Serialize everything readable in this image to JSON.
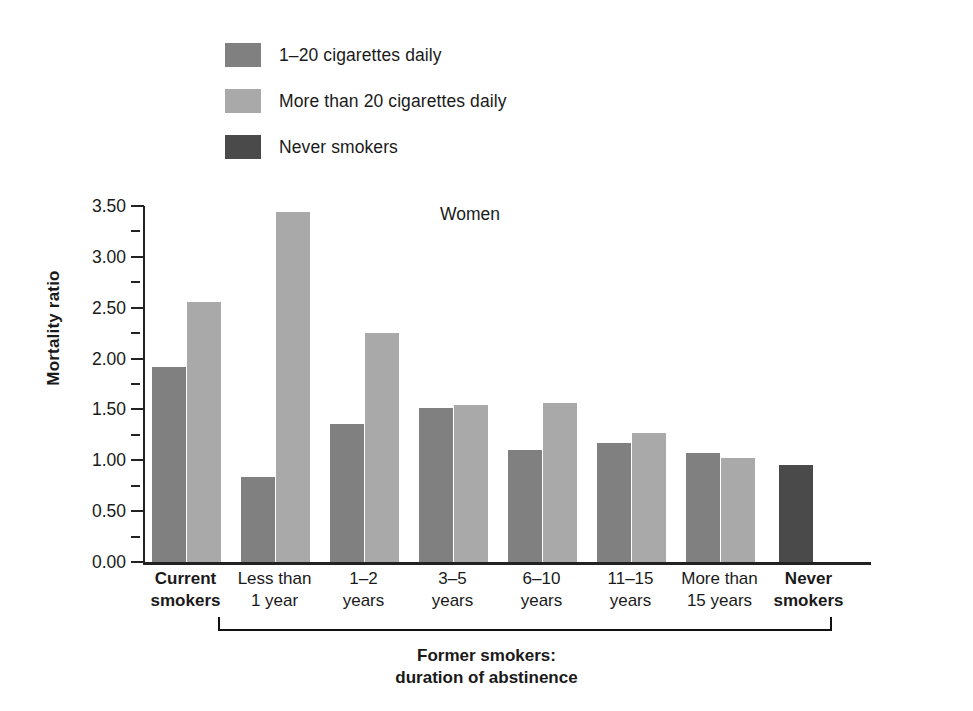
{
  "legend": {
    "items": [
      {
        "label": "1–20 cigarettes daily",
        "color": "#808080",
        "key": "light_smoker"
      },
      {
        "label": "More than 20 cigarettes daily",
        "color": "#a9a9a9",
        "key": "heavy_smoker"
      },
      {
        "label": "Never smokers",
        "color": "#4a4a4a",
        "key": "never_smoker"
      }
    ]
  },
  "chart_data": {
    "type": "bar",
    "title": "Women",
    "xlabel": "",
    "ylabel": "Mortality ratio",
    "ylim": [
      0.0,
      3.5
    ],
    "ytick_labels": [
      "0.00",
      "0.50",
      "1.00",
      "1.50",
      "2.00",
      "2.50",
      "3.00",
      "3.50"
    ],
    "ytick_values": [
      0.0,
      0.5,
      1.0,
      1.5,
      2.0,
      2.5,
      3.0,
      3.5
    ],
    "minor_tick_step": 0.25,
    "grid": false,
    "legend_position": "top-left",
    "categories": [
      "Current smokers",
      "Less than 1 year",
      "1–2 years",
      "3–5 years",
      "6–10 years",
      "11–15 years",
      "More than 15 years",
      "Never smokers"
    ],
    "category_lines": [
      [
        "Current",
        "smokers"
      ],
      [
        "Less than",
        "1 year"
      ],
      [
        "1–2",
        "years"
      ],
      [
        "3–5",
        "years"
      ],
      [
        "6–10",
        "years"
      ],
      [
        "11–15",
        "years"
      ],
      [
        "More than",
        "15 years"
      ],
      [
        "Never",
        "smokers"
      ]
    ],
    "series": [
      {
        "name": "1–20 cigarettes daily",
        "color": "#808080",
        "values": [
          1.92,
          0.84,
          1.36,
          1.51,
          1.1,
          1.17,
          1.07,
          null
        ]
      },
      {
        "name": "More than 20 cigarettes daily",
        "color": "#a9a9a9",
        "values": [
          2.56,
          3.44,
          2.25,
          1.54,
          1.56,
          1.27,
          1.02,
          null
        ]
      },
      {
        "name": "Never smokers",
        "color": "#4a4a4a",
        "values": [
          null,
          null,
          null,
          null,
          null,
          null,
          null,
          0.95
        ]
      }
    ],
    "annotation_bracket": {
      "label_line1": "Former smokers:",
      "label_line2": "duration of abstinence",
      "spans_categories": [
        "Less than 1 year",
        "More than 15 years"
      ]
    }
  }
}
